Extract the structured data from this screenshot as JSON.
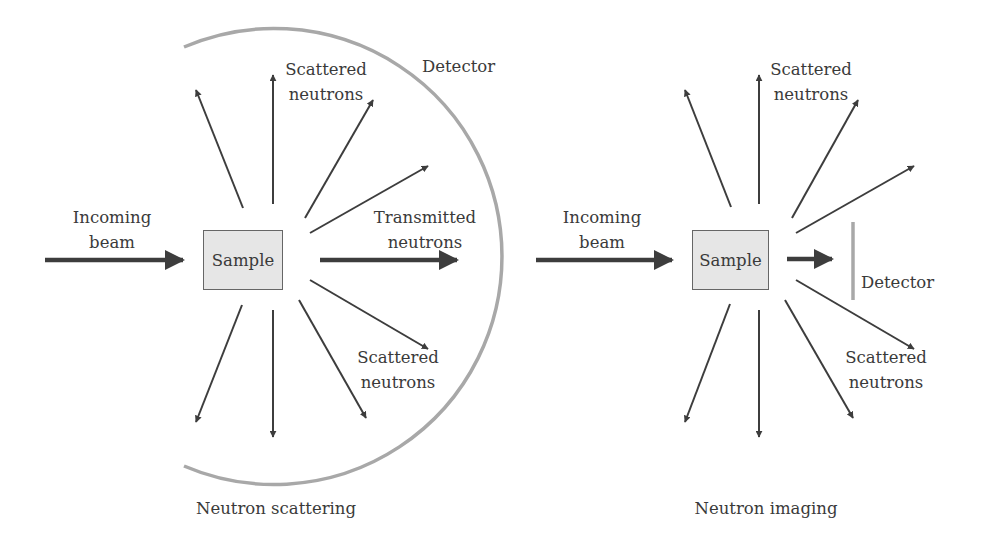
{
  "colors": {
    "arrow": "#3d3d3d",
    "detector": "#a8a8a8",
    "sample_fill": "#e6e6e6",
    "sample_border": "#666666",
    "text": "#3a3a3a"
  },
  "scattering_panel": {
    "caption": "Neutron scattering",
    "incoming_label_line1": "Incoming",
    "incoming_label_line2": "beam",
    "sample_label": "Sample",
    "detector_label": "Detector",
    "scattered_top_line1": "Scattered",
    "scattered_top_line2": "neutrons",
    "transmitted_line1": "Transmitted",
    "transmitted_line2": "neutrons",
    "scattered_bottom_line1": "Scattered",
    "scattered_bottom_line2": "neutrons"
  },
  "imaging_panel": {
    "caption": "Neutron imaging",
    "incoming_label_line1": "Incoming",
    "incoming_label_line2": "beam",
    "sample_label": "Sample",
    "detector_label": "Detector",
    "scattered_top_line1": "Scattered",
    "scattered_top_line2": "neutrons",
    "scattered_bottom_line1": "Scattered",
    "scattered_bottom_line2": "neutrons"
  }
}
